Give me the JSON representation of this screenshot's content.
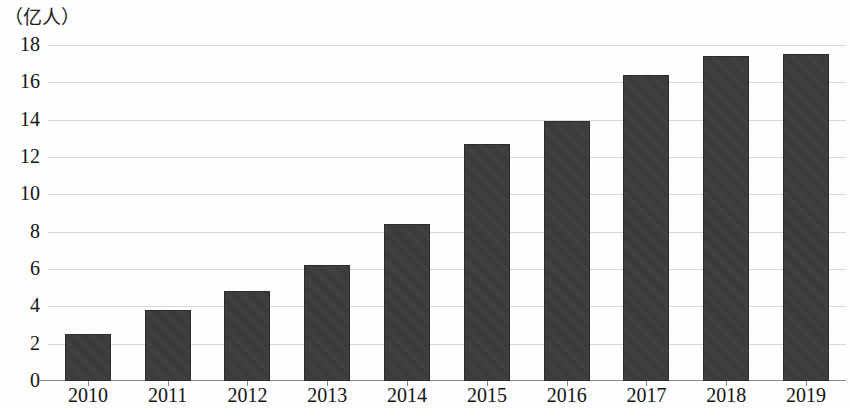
{
  "chart_data": {
    "type": "bar",
    "title": "",
    "subtitle": "",
    "unit_label": "（亿人）",
    "xlabel": "",
    "ylabel": "",
    "categories": [
      "2010",
      "2011",
      "2012",
      "2013",
      "2014",
      "2015",
      "2016",
      "2017",
      "2018",
      "2019"
    ],
    "values": [
      2.5,
      3.8,
      4.8,
      6.2,
      8.4,
      12.7,
      13.9,
      16.4,
      17.4,
      17.5
    ],
    "series": [
      {
        "name": "",
        "values": [
          2.5,
          3.8,
          4.8,
          6.2,
          8.4,
          12.7,
          13.9,
          16.4,
          17.4,
          17.5
        ]
      }
    ],
    "ylim": [
      0,
      18
    ],
    "ytick_labels": [
      "18",
      "16",
      "14",
      "12",
      "10",
      "8",
      "6",
      "4",
      "2",
      "0"
    ],
    "ytick_values": [
      18,
      16,
      14,
      12,
      10,
      8,
      6,
      4,
      2,
      0
    ],
    "ytick_step": 2,
    "grid": true,
    "grid_axis": "y",
    "legend": false,
    "legend_position": "none",
    "bar_color": "#3b3b3b",
    "grid_color": "#d9d9d9",
    "axis_color": "#888888",
    "text_color": "#141414",
    "background_color": "#fdfdfd",
    "annotations": []
  }
}
